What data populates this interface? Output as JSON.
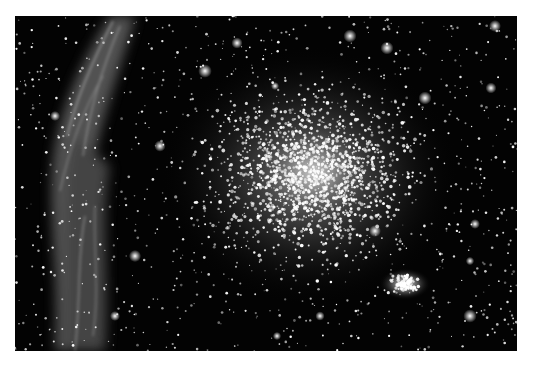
{
  "image": {
    "subject": "globular star cluster with nebula filaments",
    "description": "Dense star field with a bright cluster core right of center, a small compact secondary cluster at lower right, and wispy grey nebular filaments along the left edge",
    "colors": {
      "page_background": "#ffffff",
      "sky": "#030303",
      "stars": "#ffffff",
      "nebula": "#9a9a9a"
    },
    "layout": {
      "frame": {
        "x": 15,
        "y": 16,
        "width": 502,
        "height": 335
      },
      "cluster_core": {
        "cx": 310,
        "cy": 170,
        "r": 120
      },
      "secondary_cluster": {
        "cx": 405,
        "cy": 284,
        "r": 18
      },
      "nebula_band": {
        "x_from": 15,
        "x_to": 140
      }
    }
  }
}
